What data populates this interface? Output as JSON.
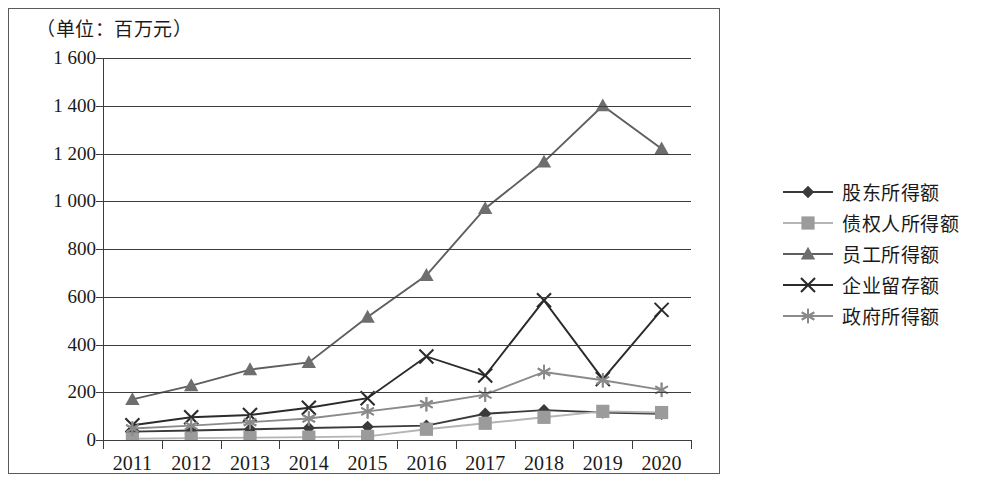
{
  "chart_data": {
    "type": "line",
    "title": "（单位：百万元）",
    "xlabel": "",
    "ylabel": "",
    "ylim": [
      0,
      1600
    ],
    "ytick_step": 200,
    "ytick_labels": [
      "1 600",
      "1 400",
      "1 200",
      "1 000",
      "800",
      "600",
      "400",
      "200",
      "0"
    ],
    "ytick_values": [
      1600,
      1400,
      1200,
      1000,
      800,
      600,
      400,
      200,
      0
    ],
    "grid": true,
    "legend_position": "right",
    "categories": [
      "2011",
      "2012",
      "2013",
      "2014",
      "2015",
      "2016",
      "2017",
      "2018",
      "2019",
      "2020"
    ],
    "x": [
      2011,
      2012,
      2013,
      2014,
      2015,
      2016,
      2017,
      2018,
      2019,
      2020
    ],
    "series": [
      {
        "name": "股东所得额",
        "marker": "diamond",
        "color": "#3a3a3a",
        "line_color": "#3a3a3a",
        "values": [
          35,
          40,
          45,
          50,
          55,
          60,
          110,
          125,
          115,
          110
        ]
      },
      {
        "name": "债权人所得额",
        "marker": "square",
        "color": "#9b9b9b",
        "line_color": "#b4b4b4",
        "values": [
          5,
          8,
          10,
          12,
          15,
          45,
          70,
          95,
          120,
          115
        ]
      },
      {
        "name": "员工所得额",
        "marker": "triangle",
        "color": "#6e6e6e",
        "line_color": "#5e5e5e",
        "values": [
          170,
          228,
          295,
          325,
          515,
          690,
          970,
          1165,
          1400,
          1220
        ]
      },
      {
        "name": "企业留存额",
        "marker": "x",
        "color": "#2b2b2b",
        "line_color": "#2b2b2b",
        "values": [
          62,
          95,
          105,
          135,
          175,
          350,
          270,
          585,
          255,
          545
        ]
      },
      {
        "name": "政府所得额",
        "marker": "asterisk",
        "color": "#8a8a8a",
        "line_color": "#8a8a8a",
        "values": [
          48,
          60,
          75,
          90,
          120,
          150,
          190,
          285,
          250,
          210
        ]
      }
    ]
  },
  "legend": {
    "items": [
      {
        "label": "股东所得额"
      },
      {
        "label": "债权人所得额"
      },
      {
        "label": "员工所得额"
      },
      {
        "label": "企业留存额"
      },
      {
        "label": "政府所得额"
      }
    ]
  }
}
